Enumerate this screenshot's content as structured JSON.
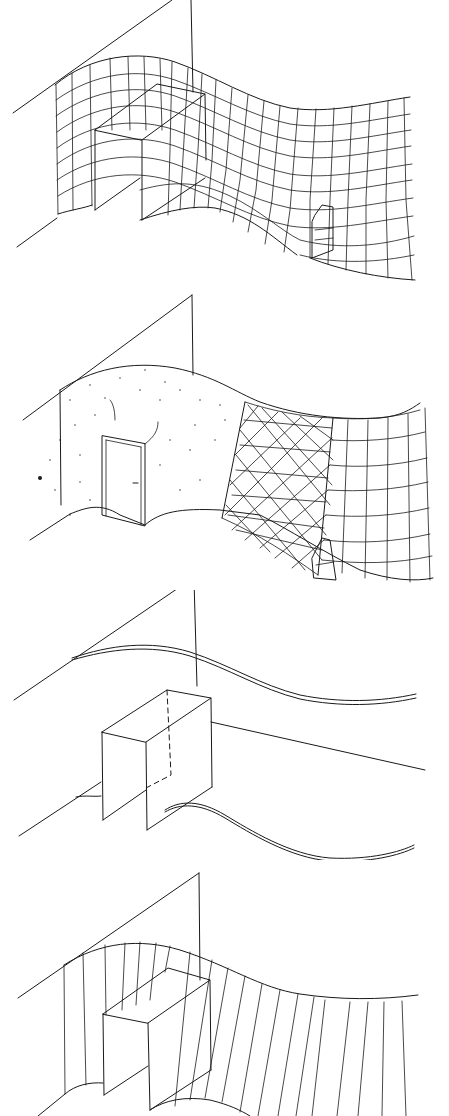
{
  "figure": {
    "type": "architectural line drawings",
    "panel_count": 4,
    "stroke_color": "#1a1a1a",
    "background": "#ffffff",
    "panels": [
      {
        "id": 1,
        "label": "",
        "description": "undulating wall with orthogonal grid mesh, rectangular doorway recess and small niche"
      },
      {
        "id": 2,
        "label": "",
        "description": "undulating wall: stippled section with door, cross-hatched section, grid section with niche"
      },
      {
        "id": 3,
        "label": "",
        "description": "wall edges only as double wavy lines with box-shaped doorway and dashed hidden edges"
      },
      {
        "id": 4,
        "label": "",
        "description": "undulating wall with vertical ruling lines and doorway box"
      }
    ]
  }
}
